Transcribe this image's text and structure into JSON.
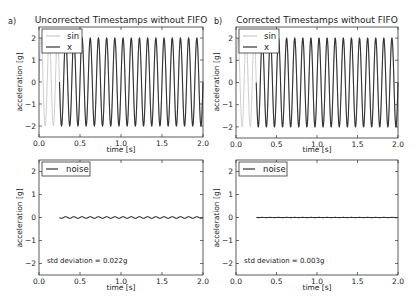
{
  "colors": {
    "sin": "#c8c8c8",
    "x": "#333333",
    "noise": "#333333",
    "axis": "#333333"
  },
  "chart_data": [
    {
      "type": "line",
      "panel_letter": "a)",
      "title": "Uncorrected Timestamps without FIFO",
      "xlabel": "time [s]",
      "ylabel": "acceleration [g]",
      "xlim": [
        0.0,
        2.0
      ],
      "ylim": [
        -2.5,
        2.5
      ],
      "xticks": [
        "0.0",
        "0.5",
        "1.0",
        "1.5",
        "2.0"
      ],
      "yticks": [
        "2",
        "1",
        "0",
        "−1",
        "−2"
      ],
      "grid": false,
      "legend_position": "upper left",
      "series": [
        {
          "name": "sin",
          "kind": "sine",
          "amplitude": 2,
          "frequency_hz": 10,
          "t_start": 0.0,
          "t_end": 2.0
        },
        {
          "name": "x",
          "kind": "sine",
          "amplitude": 2,
          "frequency_hz": 10,
          "t_start": 0.25,
          "t_end": 2.0
        }
      ]
    },
    {
      "type": "line",
      "panel_letter": "b)",
      "title": "Corrected Timestamps without FIFO",
      "xlabel": "time [s]",
      "ylabel": "acceleration [g]",
      "xlim": [
        0.0,
        2.0
      ],
      "ylim": [
        -2.5,
        2.5
      ],
      "xticks": [
        "0.0",
        "0.5",
        "1.0",
        "1.5",
        "2.0"
      ],
      "yticks": [
        "2",
        "1",
        "0",
        "−1",
        "−2"
      ],
      "grid": false,
      "legend_position": "upper left",
      "series": [
        {
          "name": "sin",
          "kind": "sine",
          "amplitude": 2,
          "frequency_hz": 10,
          "t_start": 0.0,
          "t_end": 2.0
        },
        {
          "name": "x",
          "kind": "sine",
          "amplitude": 2,
          "frequency_hz": 10,
          "t_start": 0.25,
          "t_end": 2.0
        }
      ]
    },
    {
      "type": "line",
      "panel_letter": "",
      "title": "",
      "xlabel": "time [s]",
      "ylabel": "acceleration [g]",
      "xlim": [
        0.0,
        2.0
      ],
      "ylim": [
        -2.5,
        2.5
      ],
      "xticks": [
        "0.0",
        "0.5",
        "1.0",
        "1.5",
        "2.0"
      ],
      "yticks": [
        "2",
        "1",
        "0",
        "−1",
        "−2"
      ],
      "grid": false,
      "legend_position": "upper left",
      "annotation": "std deviation = 0.022g",
      "series": [
        {
          "name": "noise",
          "kind": "sine",
          "amplitude": 0.035,
          "frequency_hz": 10,
          "t_start": 0.25,
          "t_end": 2.0
        }
      ]
    },
    {
      "type": "line",
      "panel_letter": "",
      "title": "",
      "xlabel": "time [s]",
      "ylabel": "acceleration [g]",
      "xlim": [
        0.0,
        2.0
      ],
      "ylim": [
        -2.5,
        2.5
      ],
      "xticks": [
        "0.0",
        "0.5",
        "1.0",
        "1.5",
        "2.0"
      ],
      "yticks": [
        "2",
        "1",
        "0",
        "−1",
        "−2"
      ],
      "grid": false,
      "legend_position": "upper left",
      "annotation": "std deviation = 0.003g",
      "series": [
        {
          "name": "noise",
          "kind": "sine",
          "amplitude": 0.004,
          "frequency_hz": 10,
          "t_start": 0.25,
          "t_end": 2.0
        }
      ]
    }
  ]
}
